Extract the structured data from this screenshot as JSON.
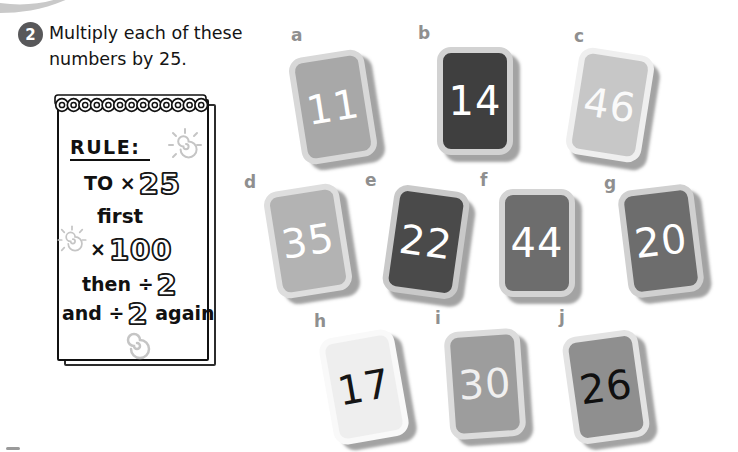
{
  "task": {
    "number": "2",
    "text_line1": "Multiply each of these",
    "text_line2": "numbers by 25."
  },
  "rule": {
    "heading": "RULE:",
    "line1_pre": "TO ×",
    "line1_num": "25",
    "line2": "first",
    "line3_pre": "×",
    "line3_num": "100",
    "line4_pre": "then ÷",
    "line4_num": "2",
    "line5_pre": "and ÷",
    "line5_num": "2",
    "line5_post": "again"
  },
  "doodles": {
    "pad_top_right": "sun-spiral",
    "pad_left_middle": "sun-spiral",
    "pad_bottom": "spiral",
    "binding": "spiral-binding",
    "color": "#c5c5c5"
  },
  "colors": {
    "page_bg": "#ffffff",
    "text": "#141414",
    "badge_bg": "#58585a",
    "label_gray": "#8f8f8f"
  },
  "cards": [
    {
      "label": "a",
      "value": "11",
      "bg": "#a8a8a8",
      "border": "#d8d8d8",
      "num_color": "#ffffff",
      "rotate": -9,
      "left": 295,
      "top": 53,
      "label_left": 291,
      "label_top": 25
    },
    {
      "label": "b",
      "value": "14",
      "bg": "#3f3f3f",
      "border": "#d2d2d2",
      "num_color": "#ffffff",
      "rotate": 0,
      "left": 437,
      "top": 47,
      "label_left": 418,
      "label_top": 23
    },
    {
      "label": "c",
      "value": "46",
      "bg": "#c7c7c7",
      "border": "#efefef",
      "num_color": "#fafafa",
      "rotate": 9,
      "left": 572,
      "top": 51,
      "label_left": 574,
      "label_top": 26
    },
    {
      "label": "d",
      "value": "35",
      "bg": "#b3b3b3",
      "border": "#dedede",
      "num_color": "#ffffff",
      "rotate": -9,
      "left": 270,
      "top": 187,
      "label_left": 244,
      "label_top": 172
    },
    {
      "label": "e",
      "value": "22",
      "bg": "#4a4a4a",
      "border": "#c9c9c9",
      "num_color": "#ffffff",
      "rotate": 8,
      "left": 388,
      "top": 188,
      "label_left": 365,
      "label_top": 170
    },
    {
      "label": "f",
      "value": "44",
      "bg": "#6d6d6d",
      "border": "#d4d4d4",
      "num_color": "#ffffff",
      "rotate": 0,
      "left": 499,
      "top": 189,
      "label_left": 480,
      "label_top": 170
    },
    {
      "label": "g",
      "value": "20",
      "bg": "#6d6d6d",
      "border": "#d0d0d0",
      "num_color": "#ffffff",
      "rotate": -7,
      "left": 623,
      "top": 187,
      "label_left": 604,
      "label_top": 173
    },
    {
      "label": "h",
      "value": "17",
      "bg": "#eeeeee",
      "border": "#f9f9f9",
      "num_color": "#151515",
      "rotate": -10,
      "left": 326,
      "top": 333,
      "label_left": 314,
      "label_top": 311
    },
    {
      "label": "i",
      "value": "30",
      "bg": "#9d9d9d",
      "border": "#dcdcdc",
      "num_color": "#f0f0f0",
      "rotate": -4,
      "left": 447,
      "top": 330,
      "label_left": 435,
      "label_top": 308
    },
    {
      "label": "j",
      "value": "26",
      "bg": "#8f8f8f",
      "border": "#e3e3e3",
      "num_color": "#101010",
      "rotate": -8,
      "left": 568,
      "top": 333,
      "label_left": 559,
      "label_top": 307
    }
  ]
}
